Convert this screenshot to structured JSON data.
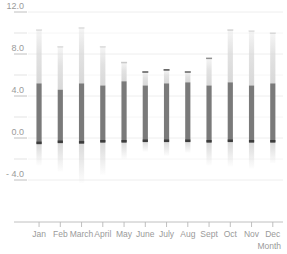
{
  "chart_data": {
    "type": "bar",
    "title": "",
    "subtitle": "",
    "xlabel": "Month",
    "ylabel": "",
    "grid": true,
    "legend": "none",
    "categories": [
      "Jan",
      "Feb",
      "March",
      "April",
      "May",
      "June",
      "July",
      "Aug",
      "Sept",
      "Oct",
      "Nov",
      "Dec"
    ],
    "ylim": [
      -5.2,
      12.6
    ],
    "yticks": [
      12.0,
      8.0,
      4.0,
      0.0,
      -4.0
    ],
    "ytick_labels": [
      "12.0",
      "8.0",
      "4.0",
      "0.0",
      "- 4.0"
    ],
    "minor_yticks": [
      10.0,
      6.0,
      2.0,
      -2.0
    ],
    "series": [
      {
        "name": "box-body-top",
        "values": [
          5.2,
          4.6,
          5.2,
          5.0,
          5.4,
          5.0,
          5.2,
          5.3,
          5.0,
          5.3,
          5.0,
          5.2
        ]
      },
      {
        "name": "box-body-bottom",
        "values": [
          -0.55,
          -0.45,
          -0.5,
          -0.4,
          -0.4,
          -0.35,
          -0.35,
          -0.35,
          -0.4,
          -0.35,
          -0.4,
          -0.4
        ]
      },
      {
        "name": "upper-whisker",
        "values": [
          10.3,
          8.7,
          10.5,
          8.7,
          7.2,
          6.3,
          6.5,
          6.3,
          7.6,
          10.3,
          10.2,
          10.0
        ]
      },
      {
        "name": "lower-whisker",
        "values": [
          -2.6,
          -3.2,
          -4.3,
          -3.5,
          -2.0,
          -1.3,
          -1.7,
          -1.4,
          -2.6,
          -2.7,
          -2.9,
          -2.4
        ]
      },
      {
        "name": "upper-cap-strength",
        "values": [
          0.15,
          0.15,
          0.15,
          0.15,
          0.25,
          0.85,
          0.9,
          0.8,
          0.55,
          0.2,
          0.15,
          0.15
        ]
      }
    ],
    "colors": {
      "body": "#7a7a7a",
      "whisker": "#d8d8d8",
      "cap": "#3d3d3d",
      "grid": "#ececec",
      "axis": "#b9b9b9",
      "text": "#9a9a9a",
      "background": "#ffffff"
    }
  }
}
